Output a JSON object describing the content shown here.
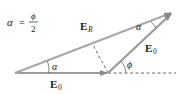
{
  "formula": {
    "lhs": "α",
    "eq": "=",
    "numerator": "ϕ",
    "denominator": "2"
  },
  "vectors": {
    "e0_horizontal": {
      "label": "E",
      "subscript": "0"
    },
    "e0_angled": {
      "label": "E",
      "subscript": "0"
    },
    "resultant": {
      "label": "E",
      "subscript": "R"
    }
  },
  "angles": {
    "alpha_origin": "α",
    "alpha_tip": "α",
    "phi": "ϕ"
  },
  "colors": {
    "vector": "#9a9a9a",
    "dashed": "#333333",
    "text": "#1a1a1a"
  }
}
